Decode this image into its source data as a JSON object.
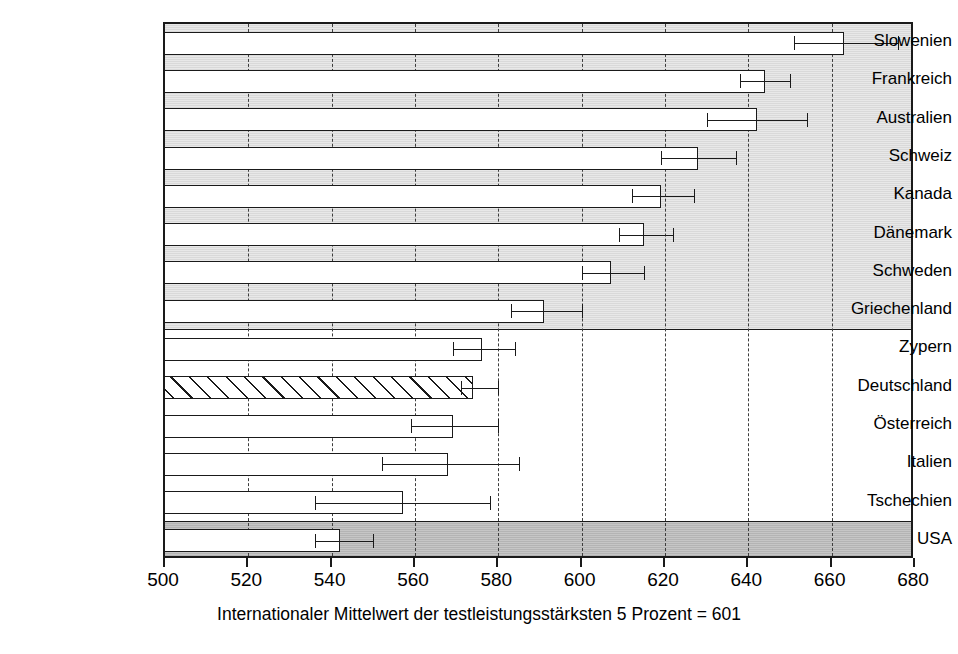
{
  "chart_data": {
    "type": "bar",
    "orientation": "horizontal",
    "title": "",
    "xlabel": "Internationaler Mittelwert der testleistungsstärksten 5 Prozent = 601",
    "ylabel": "",
    "xlim": [
      500,
      680
    ],
    "xticks": [
      500,
      520,
      540,
      560,
      580,
      600,
      620,
      640,
      660,
      680
    ],
    "xtick_labels": [
      "500",
      "520",
      "540",
      "560",
      "580",
      "600",
      "620",
      "640",
      "660",
      "680"
    ],
    "grid": "vertical-dotted",
    "legend": "none",
    "categories": [
      "Slowenien",
      "Frankreich",
      "Australien",
      "Schweiz",
      "Kanada",
      "Dänemark",
      "Schweden",
      "Griechenland",
      "Zypern",
      "Deutschland",
      "Österreich",
      "Italien",
      "Tschechien",
      "USA"
    ],
    "values": [
      663,
      644,
      642,
      628,
      619,
      615,
      607,
      591,
      576,
      574,
      569,
      568,
      557,
      542
    ],
    "error_low": [
      651,
      638,
      630,
      619,
      612,
      609,
      600,
      583,
      569,
      571,
      559,
      552,
      536,
      536
    ],
    "error_high": [
      676,
      650,
      654,
      637,
      627,
      622,
      615,
      600,
      584,
      580,
      580,
      585,
      578,
      550
    ],
    "bars": [
      {
        "label": "Slowenien",
        "value": 663,
        "low": 651,
        "high": 676,
        "group": "above",
        "style": "open"
      },
      {
        "label": "Frankreich",
        "value": 644,
        "low": 638,
        "high": 650,
        "group": "above",
        "style": "open"
      },
      {
        "label": "Australien",
        "value": 642,
        "low": 630,
        "high": 654,
        "group": "above",
        "style": "open"
      },
      {
        "label": "Schweiz",
        "value": 628,
        "low": 619,
        "high": 637,
        "group": "above",
        "style": "open"
      },
      {
        "label": "Kanada",
        "value": 619,
        "low": 612,
        "high": 627,
        "group": "above",
        "style": "open"
      },
      {
        "label": "Dänemark",
        "value": 615,
        "low": 609,
        "high": 622,
        "group": "above",
        "style": "open"
      },
      {
        "label": "Schweden",
        "value": 607,
        "low": 600,
        "high": 615,
        "group": "above",
        "style": "open"
      },
      {
        "label": "Griechenland",
        "value": 591,
        "low": 583,
        "high": 600,
        "group": "above",
        "style": "open"
      },
      {
        "label": "Zypern",
        "value": 576,
        "low": 569,
        "high": 584,
        "group": "equal",
        "style": "open"
      },
      {
        "label": "Deutschland",
        "value": 574,
        "low": 571,
        "high": 580,
        "group": "equal",
        "style": "hatched"
      },
      {
        "label": "Österreich",
        "value": 569,
        "low": 559,
        "high": 580,
        "group": "equal",
        "style": "open"
      },
      {
        "label": "Italien",
        "value": 568,
        "low": 552,
        "high": 585,
        "group": "equal",
        "style": "open"
      },
      {
        "label": "Tschechien",
        "value": 557,
        "low": 536,
        "high": 578,
        "group": "equal",
        "style": "open"
      },
      {
        "label": "USA",
        "value": 542,
        "low": 536,
        "high": 550,
        "group": "below",
        "style": "open"
      }
    ],
    "group_bands": [
      {
        "name": "above-german-average",
        "shade": "light-gray",
        "first_index": 0,
        "last_index": 7
      },
      {
        "name": "not-different-from-german-average",
        "shade": "white",
        "first_index": 8,
        "last_index": 12
      },
      {
        "name": "below-german-average",
        "shade": "dark-gray",
        "first_index": 13,
        "last_index": 13
      }
    ],
    "colors": {
      "bar_fill": "#ffffff",
      "bar_outline": "#1a1a1a",
      "band_light": "#e2e2e2",
      "band_white": "#ffffff",
      "band_dark": "#bdbdbd",
      "grid": "#3d3d3d",
      "text": "#000000"
    }
  }
}
